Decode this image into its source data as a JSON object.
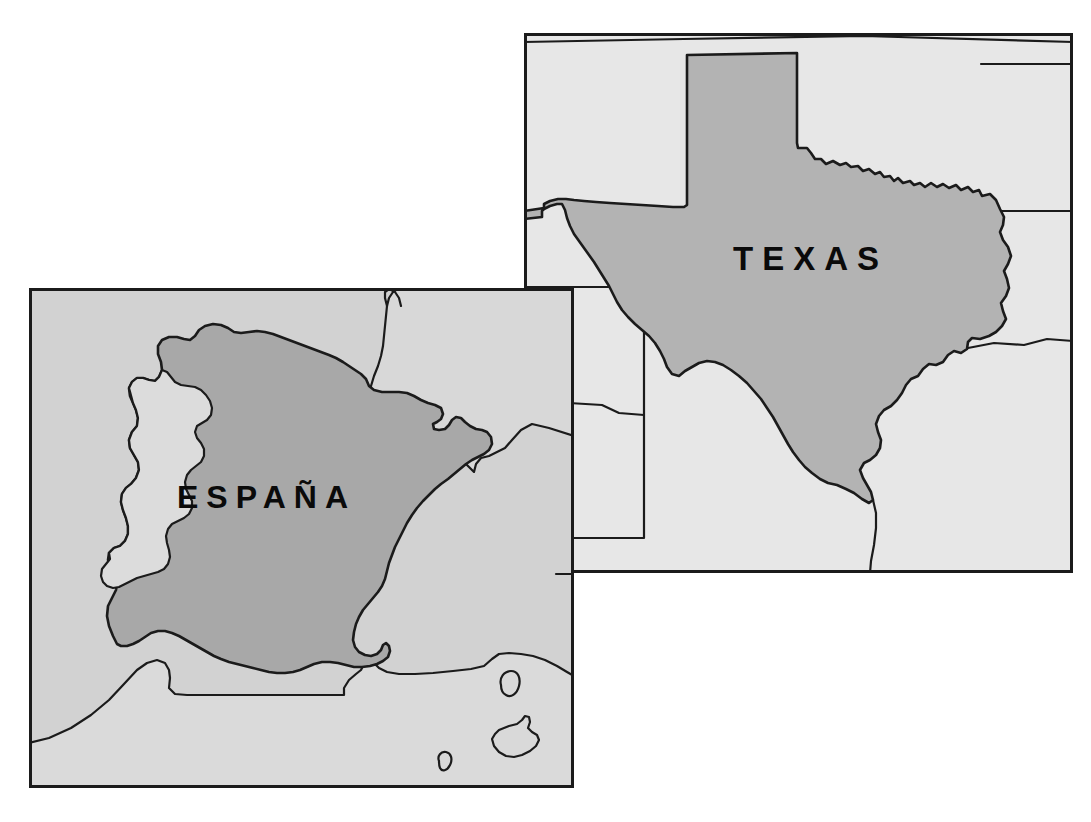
{
  "figure": {
    "kind": "comparative-outline-map",
    "background_color": "#ffffff",
    "panels": [
      {
        "id": "texas",
        "label": "TEXAS",
        "frame": {
          "x": 524,
          "y": 33,
          "width": 549,
          "height": 540
        },
        "colors": {
          "sea": "#e6e6e6",
          "neighbor_land": "#e4e4e4",
          "focus_land": "#b0b0b0",
          "outline": "#1b1b1b",
          "label": "#0a0a0a"
        },
        "label_position": {
          "x": 733,
          "y": 260
        }
      },
      {
        "id": "espana",
        "label": "ESPAÑA",
        "frame": {
          "x": 29,
          "y": 288,
          "width": 545,
          "height": 500
        },
        "colors": {
          "sea": "#cfcfcf",
          "neighbor_land": "#d6d6d6",
          "focus_land": "#a9a9a9",
          "outline": "#1b1b1b",
          "label": "#0a0a0a"
        },
        "label_position": {
          "x": 175,
          "y": 500
        },
        "islands": [
          "Mallorca",
          "Menorca",
          "Ibiza"
        ]
      }
    ],
    "stacking_note": "espana panel drawn on top of texas panel"
  }
}
